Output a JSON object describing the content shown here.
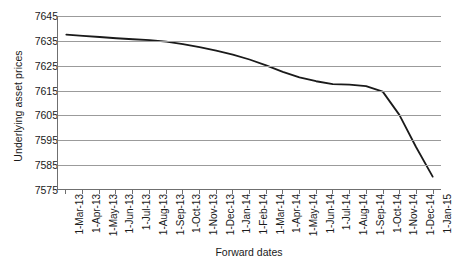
{
  "chart_data": {
    "type": "line",
    "title": "",
    "xlabel": "Forward dates",
    "ylabel": "Underlying asset prices",
    "ylim": [
      7575,
      7645
    ],
    "ytick_step": 10,
    "yticks": [
      7645,
      7635,
      7625,
      7615,
      7605,
      7595,
      7585,
      7575
    ],
    "grid": true,
    "legend": null,
    "line_color": "#1a1a1a",
    "grid_color": "#9b9b9b",
    "axis_color": "#6f6f6f",
    "categories": [
      "1-Mar-13",
      "1-Apr-13",
      "1-May-13",
      "1-Jun-13",
      "1-Jul-13",
      "1-Aug-13",
      "1-Sep-13",
      "1-Oct-13",
      "1-Nov-13",
      "1-Dec-13",
      "1-Jan-14",
      "1-Feb-14",
      "1-Mar-14",
      "1-Apr-14",
      "1-May-14",
      "1-Jun-14",
      "1-Jul-14",
      "1-Aug-14",
      "1-Sep-14",
      "1-Oct-14",
      "1-Nov-14",
      "1-Dec-14",
      "1-Jan-15"
    ],
    "values": [
      7637.5,
      7637.0,
      7636.5,
      7636.0,
      7635.6,
      7635.2,
      7634.6,
      7633.6,
      7632.4,
      7631.0,
      7629.4,
      7627.4,
      7625.0,
      7622.4,
      7620.2,
      7618.6,
      7617.4,
      7617.2,
      7616.6,
      7614.4,
      7605.0,
      7592.0,
      7580.0
    ]
  }
}
